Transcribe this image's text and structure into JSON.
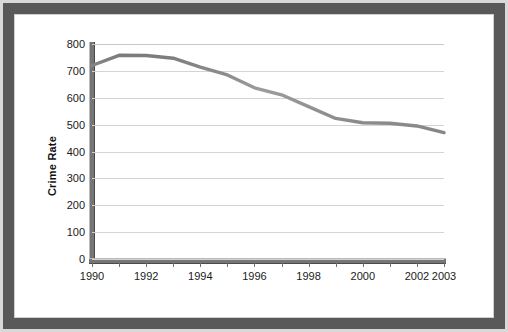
{
  "figure": {
    "frame_color": "#595959",
    "panel_background": "#ffffff"
  },
  "chart_data": {
    "type": "line",
    "title": "",
    "xlabel": "",
    "ylabel": "Crime Rate",
    "x": [
      1990,
      1991,
      1992,
      1993,
      1994,
      1995,
      1996,
      1997,
      1998,
      1999,
      2000,
      2001,
      2002,
      2003
    ],
    "values": [
      720,
      758,
      757,
      747,
      714,
      685,
      637,
      611,
      567,
      523,
      507,
      505,
      495,
      470
    ],
    "series": [
      {
        "name": "Crime Rate",
        "color": "#8f8f8f",
        "values": [
          720,
          758,
          757,
          747,
          714,
          685,
          637,
          611,
          567,
          523,
          507,
          505,
          495,
          470
        ]
      }
    ],
    "xlim": [
      1990,
      2003
    ],
    "ylim": [
      0,
      800
    ],
    "y_ticks": [
      0,
      100,
      200,
      300,
      400,
      500,
      600,
      700,
      800
    ],
    "y_tick_labels": [
      "0",
      "100",
      "200",
      "300",
      "400",
      "500",
      "600",
      "700",
      "800"
    ],
    "x_ticks": [
      1990,
      1991,
      1992,
      1993,
      1994,
      1995,
      1996,
      1997,
      1998,
      1999,
      2000,
      2001,
      2002,
      2003
    ],
    "x_tick_labels": [
      {
        "value": 1990,
        "label": "1990"
      },
      {
        "value": 1991,
        "label": ""
      },
      {
        "value": 1992,
        "label": "1992"
      },
      {
        "value": 1993,
        "label": ""
      },
      {
        "value": 1994,
        "label": "1994"
      },
      {
        "value": 1995,
        "label": ""
      },
      {
        "value": 1996,
        "label": "1996"
      },
      {
        "value": 1997,
        "label": ""
      },
      {
        "value": 1998,
        "label": "1998"
      },
      {
        "value": 1999,
        "label": ""
      },
      {
        "value": 2000,
        "label": "2000"
      },
      {
        "value": 2001,
        "label": ""
      },
      {
        "value": 2002,
        "label": "2002"
      },
      {
        "value": 2003,
        "label": "2003"
      }
    ],
    "grid": true,
    "grid_color": "#d4d4d4",
    "legend": false,
    "legend_position": "none"
  }
}
